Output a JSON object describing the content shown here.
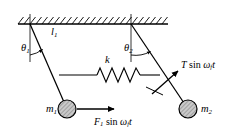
{
  "figure": {
    "type": "physics-schematic",
    "width": 232,
    "height": 138,
    "background_color": "#ffffff",
    "line_color": "#000000",
    "mass_fill_color": "#b3b3b3"
  },
  "labels": {
    "theta1": {
      "symbol": "θ",
      "subscript": "1",
      "x": 22,
      "y": 48
    },
    "theta2": {
      "symbol": "θ",
      "subscript": "2",
      "x": 125,
      "y": 48
    },
    "length1": {
      "symbol": "l",
      "subscript": "1",
      "x": 51,
      "y": 32
    },
    "spring_constant": {
      "symbol": "k",
      "subscript": "",
      "x": 107,
      "y": 61
    },
    "mass1": {
      "symbol": "m",
      "subscript": "1",
      "x": 53,
      "y": 110
    },
    "mass2": {
      "symbol": "m",
      "subscript": "2",
      "x": 202,
      "y": 110
    },
    "force1": {
      "text_italic_a": "F",
      "sub_a": "1",
      "text_upright": " sin ",
      "text_italic_b": "ω",
      "sub_b": "f",
      "text_italic_c": "t",
      "x": 98,
      "y": 122
    },
    "tension": {
      "text_italic_a": "T",
      "text_upright": " sin ",
      "text_italic_b": "ω",
      "sub_b": "f",
      "text_italic_c": "t",
      "x": 184,
      "y": 65
    }
  },
  "geometry": {
    "ceiling": {
      "x1": 18,
      "y1": 24,
      "x2": 168,
      "y2": 24,
      "hatch_count": 24,
      "hatch_length": 7
    },
    "pivot1": {
      "x": 30,
      "y": 24
    },
    "pivot2": {
      "x": 131,
      "y": 24
    },
    "bob1": {
      "cx": 67,
      "cy": 109,
      "r": 9
    },
    "bob2": {
      "cx": 188,
      "cy": 109,
      "r": 9
    },
    "vertical1": {
      "x": 30,
      "y1": 24,
      "y2": 62
    },
    "vertical2": {
      "x": 131,
      "y1": 24,
      "y2": 62
    },
    "spring": {
      "x1": 59,
      "y1": 75,
      "x2": 160,
      "y2": 75,
      "coils": 7
    },
    "force_arrow": {
      "x1": 79,
      "y1": 109,
      "x2": 114,
      "y2": 109
    },
    "tension_arrow": {
      "x1": 150,
      "y1": 93,
      "x2": 178,
      "y2": 71
    }
  }
}
